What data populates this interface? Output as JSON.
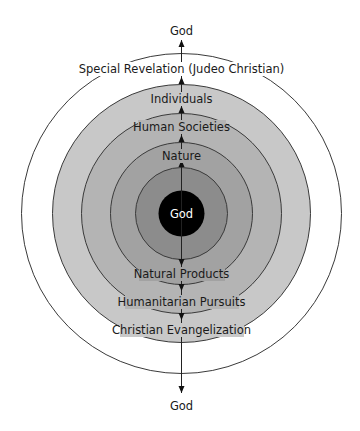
{
  "diagram": {
    "top_label": "God",
    "bottom_label": "God",
    "center_label": "God",
    "outer_ring_label": "Special Revelation (Judeo Christian)",
    "upper_labels": [
      "Individuals",
      "Human Societies",
      "Nature"
    ],
    "lower_labels": [
      "Natural Products",
      "Humanitarian Pursuits",
      "Christian Evangelization"
    ],
    "rings": [
      {
        "name": "outer",
        "radius": 160,
        "fill": "#ffffff"
      },
      {
        "name": "ring-1",
        "radius": 129,
        "fill": "#c8c8c8"
      },
      {
        "name": "ring-2",
        "radius": 100,
        "fill": "#b4b4b4"
      },
      {
        "name": "ring-3",
        "radius": 71,
        "fill": "#a2a2a2"
      },
      {
        "name": "ring-4",
        "radius": 46,
        "fill": "#8a8a8a"
      },
      {
        "name": "core",
        "radius": 23,
        "fill": "#000000"
      }
    ],
    "arrows": {
      "upward": "from center toward top God",
      "downward": "from center toward bottom God"
    }
  }
}
